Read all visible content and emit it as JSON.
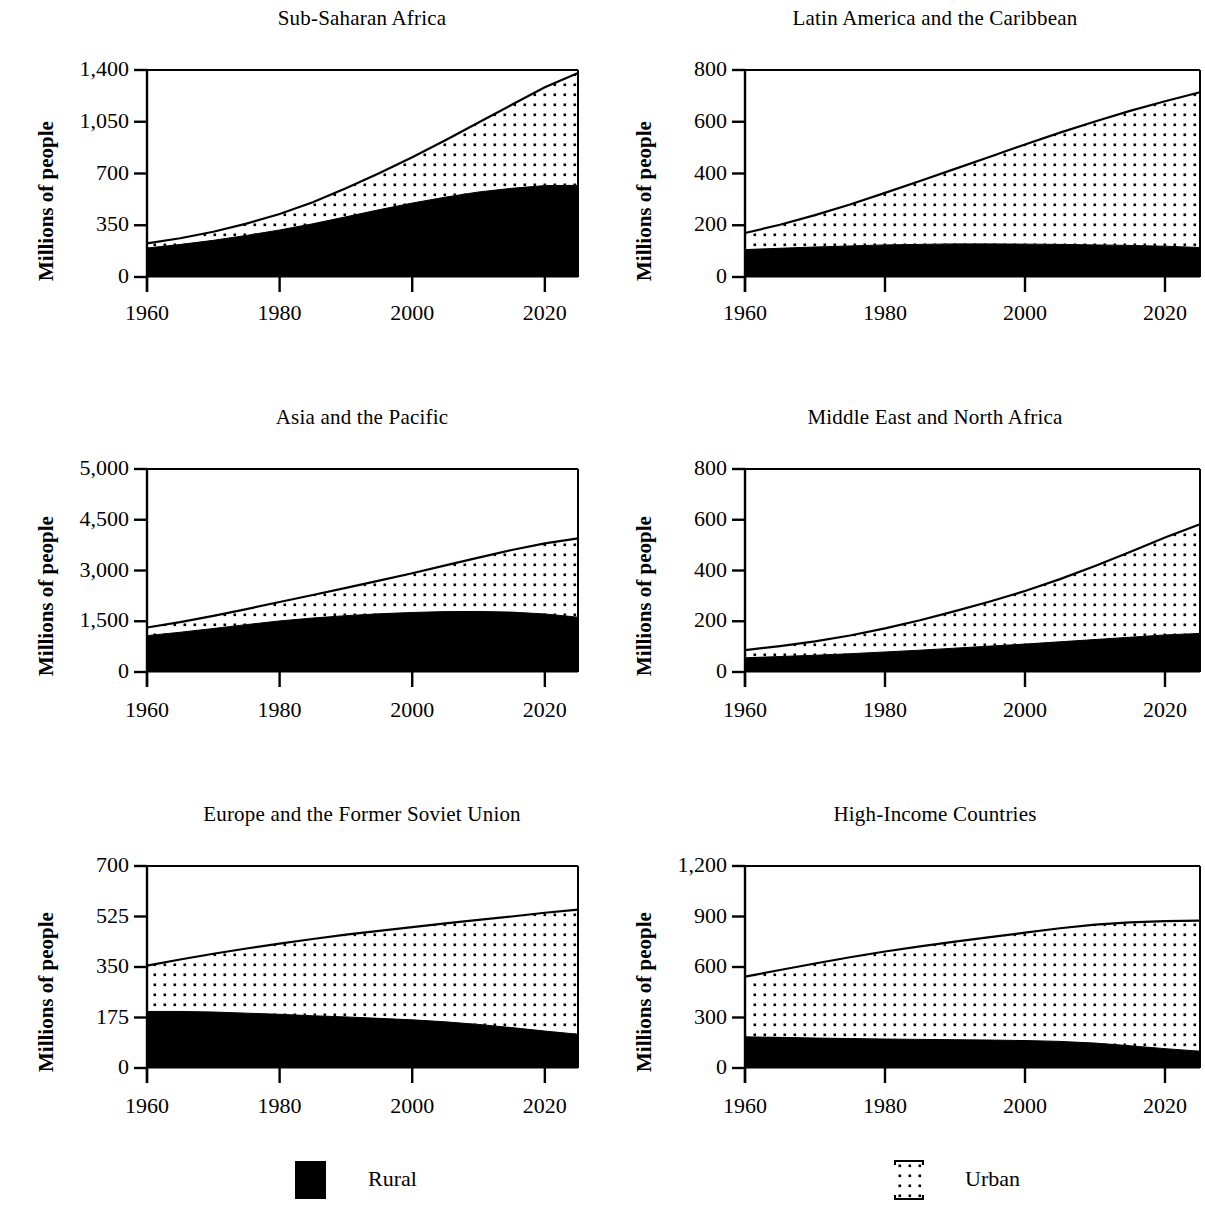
{
  "figure": {
    "ylabel": "Millions of people",
    "legend": {
      "rural_label": "Rural",
      "urban_label": "Urban",
      "rural_color": "#000000",
      "urban_color": "#ffffff"
    }
  },
  "chart_data": [
    {
      "type": "area",
      "title": "Sub-Saharan Africa",
      "xlabel": "",
      "ylabel": "Millions of people",
      "xlim": [
        1960,
        2025
      ],
      "ylim": [
        0,
        1400
      ],
      "xticks": [
        1960,
        1980,
        2000,
        2020
      ],
      "xtick_labels": [
        "1960",
        "1980",
        "2000",
        "2020"
      ],
      "yticks": [
        0,
        350,
        700,
        1050,
        1400
      ],
      "ytick_labels": [
        "0",
        "350",
        "700",
        "1,050",
        "1,400"
      ],
      "grid": false,
      "stacked": true,
      "x": [
        1960,
        1965,
        1970,
        1975,
        1980,
        1985,
        1990,
        1995,
        2000,
        2005,
        2010,
        2015,
        2020,
        2025
      ],
      "series": [
        {
          "name": "Rural",
          "values": [
            196,
            220,
            248,
            281,
            318,
            360,
            407,
            455,
            500,
            540,
            575,
            600,
            618,
            620
          ]
        },
        {
          "name": "Urban",
          "values": [
            31,
            42,
            58,
            80,
            108,
            146,
            193,
            247,
            310,
            385,
            470,
            565,
            665,
            760
          ]
        }
      ],
      "totals": [
        227,
        262,
        306,
        361,
        426,
        506,
        600,
        702,
        810,
        925,
        1045,
        1165,
        1283,
        1380
      ]
    },
    {
      "type": "area",
      "title": "Latin America and the Caribbean",
      "xlabel": "",
      "ylabel": "Millions of people",
      "xlim": [
        1960,
        2025
      ],
      "ylim": [
        0,
        800
      ],
      "xticks": [
        1960,
        1980,
        2000,
        2020
      ],
      "xtick_labels": [
        "1960",
        "1980",
        "2000",
        "2020"
      ],
      "yticks": [
        0,
        200,
        400,
        600,
        800
      ],
      "ytick_labels": [
        "0",
        "200",
        "400",
        "600",
        "800"
      ],
      "grid": false,
      "stacked": true,
      "x": [
        1960,
        1965,
        1970,
        1975,
        1980,
        1985,
        1990,
        1995,
        2000,
        2005,
        2010,
        2015,
        2020,
        2025
      ],
      "series": [
        {
          "name": "Rural",
          "values": [
            106,
            111,
            116,
            120,
            124,
            126,
            128,
            128,
            127,
            126,
            124,
            122,
            119,
            114
          ]
        },
        {
          "name": "Urban",
          "values": [
            64,
            91,
            123,
            160,
            201,
            245,
            290,
            337,
            385,
            432,
            477,
            520,
            560,
            600
          ]
        }
      ],
      "totals": [
        170,
        202,
        239,
        280,
        325,
        371,
        418,
        465,
        512,
        558,
        601,
        642,
        679,
        714
      ]
    },
    {
      "type": "area",
      "title": "Asia and the Pacific",
      "xlabel": "",
      "ylabel": "Millions of people",
      "xlim": [
        1960,
        2025
      ],
      "ylim": [
        0,
        5000
      ],
      "xticks": [
        1960,
        1980,
        2000,
        2020
      ],
      "xtick_labels": [
        "1960",
        "1980",
        "2000",
        "2020"
      ],
      "yticks": [
        0,
        1500,
        3000,
        4500,
        5000
      ],
      "ytick_labels": [
        "0",
        "1,500",
        "3,000",
        "4,500",
        "5,000"
      ],
      "ytick_spacing": "equal-irregular",
      "grid": false,
      "stacked": true,
      "x": [
        1960,
        1965,
        1970,
        1975,
        1980,
        1985,
        1990,
        1995,
        2000,
        2005,
        2010,
        2015,
        2020,
        2025
      ],
      "series": [
        {
          "name": "Rural",
          "values": [
            1075,
            1175,
            1285,
            1400,
            1510,
            1595,
            1665,
            1720,
            1760,
            1785,
            1790,
            1770,
            1715,
            1620
          ]
        },
        {
          "name": "Urban",
          "values": [
            240,
            300,
            375,
            460,
            560,
            680,
            820,
            980,
            1160,
            1365,
            1590,
            1835,
            2085,
            2330
          ]
        }
      ],
      "totals": [
        1315,
        1475,
        1660,
        1860,
        2070,
        2275,
        2485,
        2700,
        2920,
        3150,
        3380,
        3605,
        3800,
        3950
      ]
    },
    {
      "type": "area",
      "title": "Middle East and North Africa",
      "xlabel": "",
      "ylabel": "Millions of people",
      "xlim": [
        1960,
        2025
      ],
      "ylim": [
        0,
        800
      ],
      "xticks": [
        1960,
        1980,
        2000,
        2020
      ],
      "xtick_labels": [
        "1960",
        "1980",
        "2000",
        "2020"
      ],
      "yticks": [
        0,
        200,
        400,
        600,
        800
      ],
      "ytick_labels": [
        "0",
        "200",
        "400",
        "600",
        "800"
      ],
      "grid": false,
      "stacked": true,
      "x": [
        1960,
        1965,
        1970,
        1975,
        1980,
        1985,
        1990,
        1995,
        2000,
        2005,
        2010,
        2015,
        2020,
        2025
      ],
      "series": [
        {
          "name": "Rural",
          "values": [
            56,
            61,
            66,
            72,
            79,
            86,
            94,
            102,
            110,
            119,
            128,
            137,
            146,
            152
          ]
        },
        {
          "name": "Urban",
          "values": [
            30,
            41,
            55,
            72,
            93,
            118,
            146,
            176,
            209,
            247,
            290,
            336,
            384,
            430
          ]
        }
      ],
      "totals": [
        86,
        102,
        121,
        144,
        172,
        204,
        240,
        278,
        319,
        366,
        418,
        473,
        530,
        582
      ]
    },
    {
      "type": "area",
      "title": "Europe and the Former Soviet Union",
      "xlabel": "",
      "ylabel": "Millions of people",
      "xlim": [
        1960,
        2025
      ],
      "ylim": [
        0,
        700
      ],
      "xticks": [
        1960,
        1980,
        2000,
        2020
      ],
      "xtick_labels": [
        "1960",
        "1980",
        "2000",
        "2020"
      ],
      "yticks": [
        0,
        175,
        350,
        525,
        700
      ],
      "ytick_labels": [
        "0",
        "175",
        "350",
        "525",
        "700"
      ],
      "grid": false,
      "stacked": true,
      "x": [
        1960,
        1965,
        1970,
        1975,
        1980,
        1985,
        1990,
        1995,
        2000,
        2005,
        2010,
        2015,
        2020,
        2025
      ],
      "series": [
        {
          "name": "Rural",
          "values": [
            196,
            196,
            194,
            190,
            186,
            181,
            177,
            172,
            167,
            160,
            151,
            140,
            128,
            117
          ]
        },
        {
          "name": "Urban",
          "values": [
            159,
            180,
            202,
            224,
            245,
            266,
            285,
            303,
            321,
            341,
            362,
            385,
            410,
            432
          ]
        }
      ],
      "totals": [
        355,
        376,
        396,
        414,
        431,
        447,
        462,
        475,
        488,
        501,
        513,
        525,
        538,
        549
      ]
    },
    {
      "type": "area",
      "title": "High-Income Countries",
      "xlabel": "",
      "ylabel": "Millions of people",
      "xlim": [
        1960,
        2025
      ],
      "ylim": [
        0,
        1200
      ],
      "xticks": [
        1960,
        1980,
        2000,
        2020
      ],
      "xtick_labels": [
        "1960",
        "1980",
        "2000",
        "2020"
      ],
      "yticks": [
        0,
        300,
        600,
        900,
        1200
      ],
      "ytick_labels": [
        "0",
        "300",
        "600",
        "900",
        "1,200"
      ],
      "grid": false,
      "stacked": true,
      "x": [
        1960,
        1965,
        1970,
        1975,
        1980,
        1985,
        1990,
        1995,
        2000,
        2005,
        2010,
        2015,
        2020,
        2025
      ],
      "series": [
        {
          "name": "Rural",
          "values": [
            185,
            182,
            178,
            175,
            172,
            170,
            168,
            166,
            163,
            158,
            148,
            132,
            115,
            100
          ]
        },
        {
          "name": "Urban",
          "values": [
            358,
            400,
            443,
            483,
            520,
            553,
            583,
            612,
            641,
            672,
            704,
            733,
            757,
            775
          ]
        }
      ],
      "totals": [
        543,
        582,
        621,
        658,
        692,
        723,
        751,
        778,
        804,
        830,
        852,
        865,
        872,
        875
      ]
    }
  ]
}
